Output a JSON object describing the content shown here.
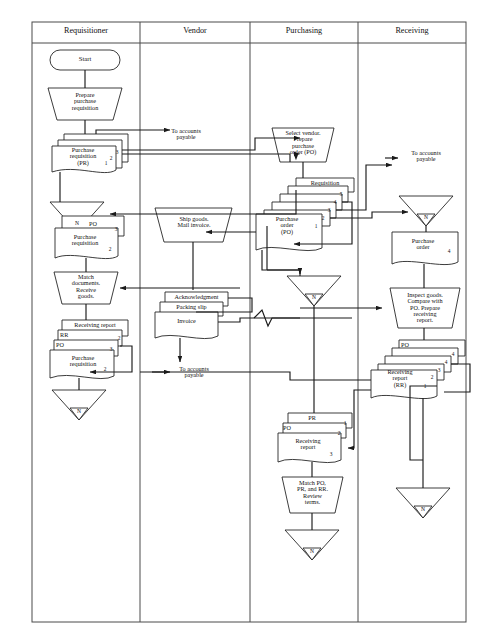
{
  "diagram": {
    "stroke_color": "#1a1a1a",
    "fill_color": "#ffffff",
    "background": "#ffffff"
  },
  "columns": [
    {
      "label": "Requisitioner"
    },
    {
      "label": "Vendor"
    },
    {
      "label": "Purchasing"
    },
    {
      "label": "Receiving"
    }
  ],
  "requisitioner": {
    "start": "Start",
    "prepare_pr": "Prepare\npurchase\nrequisition",
    "pr_stack": {
      "label": "Purchase\nrequisition\n(PR)",
      "copies": [
        "1",
        "2",
        "3"
      ]
    },
    "file_1": "N",
    "po_doc": {
      "label": "PO",
      "copy": "3"
    },
    "pr_doc": {
      "label": "Purchase\nrequisition",
      "copy": "2"
    },
    "match_docs": "Match\ndocuments.\nReceive\ngoods.",
    "final_stack": {
      "rr_label": "Receiving report",
      "rr_copy": "2",
      "rr_short": "RR",
      "po_label": "PO",
      "po_copy": "3",
      "pr_label": "Purchase\nrequisition",
      "pr_copy": "2"
    },
    "file_2": "N"
  },
  "vendor": {
    "ship_goods": "Ship goods.\nMail invoice.",
    "acknowledgment": "Acknowledgment",
    "packing_slip": "Packing slip",
    "invoice": "Invoice",
    "to_ap": "To accounts\npayable"
  },
  "purchasing": {
    "select_vendor": "Select vendor.\nPrepare\npurchase\norder (PO)",
    "requisition_top": "Requisition",
    "po_stack": {
      "label": "Purchase\norder\n(PO)",
      "copies": [
        "1",
        "2",
        "3",
        "4",
        "5"
      ]
    },
    "file_1": "N",
    "doc_pr": {
      "label": "PR",
      "copy": "1"
    },
    "doc_po": {
      "label": "PO",
      "copy": "2"
    },
    "doc_rr": {
      "label": "Receiving\nreport",
      "copy": "3"
    },
    "match_review": "Match PO,\nPR, and RR.\nReview\nterms.",
    "file_2": "N"
  },
  "receiving": {
    "to_ap": "To accounts\npayable",
    "file_1": "N",
    "po_doc": {
      "label": "Purchase\norder",
      "copy": "4"
    },
    "inspect_goods": "Inspect goods.\nCompare with\nPO. Prepare\nreceiving\nreport.",
    "rr_stack": {
      "po_label": "PO",
      "label": "Receiving\nreport\n(RR)",
      "copies": [
        "1",
        "2",
        "3",
        "4",
        "4"
      ]
    },
    "file_2": "N"
  },
  "annotations": {
    "to_ap_requisitioner": "To accounts\npayable"
  }
}
